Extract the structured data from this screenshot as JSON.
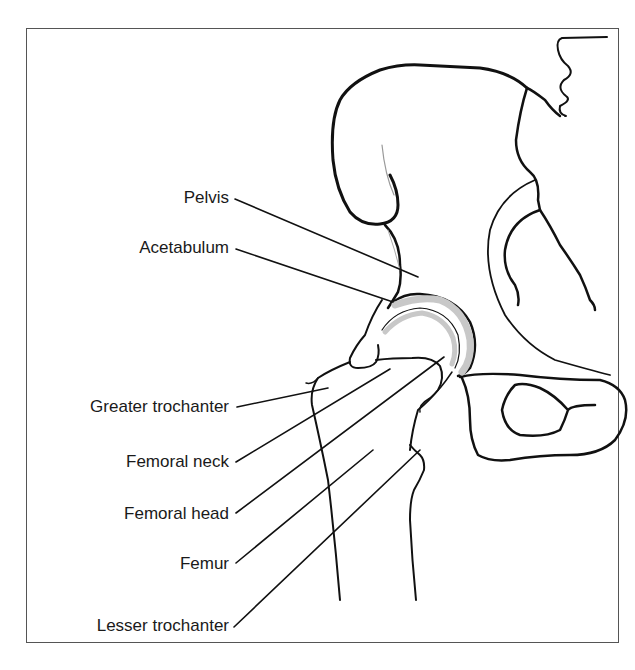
{
  "diagram": {
    "colors": {
      "line": "#111111",
      "cartilage": "#c8c8c8",
      "frame": "#555555",
      "background": "#ffffff"
    },
    "labels": [
      {
        "id": "pelvis",
        "text": "Pelvis"
      },
      {
        "id": "acetabulum",
        "text": "Acetabulum"
      },
      {
        "id": "greater_trochanter",
        "text": "Greater trochanter"
      },
      {
        "id": "femoral_neck",
        "text": "Femoral neck"
      },
      {
        "id": "femoral_head",
        "text": "Femoral head"
      },
      {
        "id": "femur",
        "text": "Femur"
      },
      {
        "id": "lesser_trochanter",
        "text": "Lesser trochanter"
      }
    ]
  }
}
